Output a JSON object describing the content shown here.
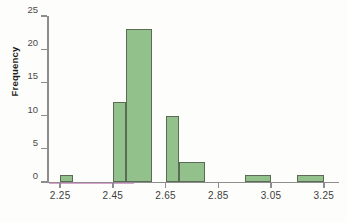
{
  "chart_data": {
    "type": "bar",
    "title": "",
    "subtitle": "",
    "xlabel": "",
    "ylabel": "Frequency",
    "xlim": [
      2.2,
      3.3
    ],
    "ylim": [
      0,
      25
    ],
    "grid": false,
    "legend": null,
    "bin_width": 0.05,
    "xticks": [
      "2.25",
      "2.45",
      "2.65",
      "2.85",
      "3.05",
      "3.25"
    ],
    "xtick_values": [
      2.25,
      2.45,
      2.65,
      2.85,
      3.05,
      3.25
    ],
    "yticks": [
      "0",
      "5",
      "10",
      "15",
      "20",
      "25"
    ],
    "ytick_values": [
      0,
      5,
      10,
      15,
      20,
      25
    ],
    "categories": [
      "2.25-2.30",
      "2.45-2.50",
      "2.50-2.60",
      "2.65-2.70",
      "2.70-2.80",
      "2.95-3.05",
      "3.15-3.25"
    ],
    "values": [
      1,
      12,
      23,
      10,
      3,
      1,
      1
    ],
    "bins": [
      {
        "label": "2.25-2.30",
        "start": 2.25,
        "end": 2.3,
        "value": 1
      },
      {
        "label": "2.45-2.50",
        "start": 2.45,
        "end": 2.5,
        "value": 12
      },
      {
        "label": "2.50-2.60",
        "start": 2.5,
        "end": 2.6,
        "value": 23
      },
      {
        "label": "2.65-2.70",
        "start": 2.65,
        "end": 2.7,
        "value": 10
      },
      {
        "label": "2.70-2.80",
        "start": 2.7,
        "end": 2.8,
        "value": 3
      },
      {
        "label": "2.95-3.05",
        "start": 2.95,
        "end": 3.05,
        "value": 1
      },
      {
        "label": "3.15-3.25",
        "start": 3.15,
        "end": 3.25,
        "value": 1
      }
    ],
    "colors": {
      "bar_fill": "#93c18b",
      "bar_border": "#5c6b55",
      "axis": "#8d8d8d",
      "baseline_accent": "#d79ccd",
      "tick_label": "#3d3d3b",
      "axis_title": "#1d1d1b",
      "background": "#fdfdfc"
    }
  }
}
